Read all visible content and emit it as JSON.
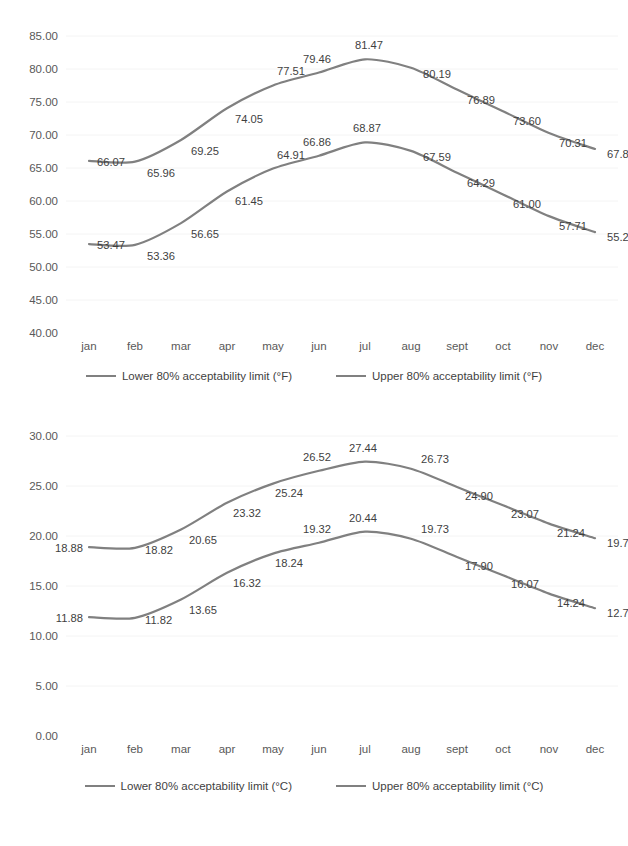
{
  "page": {
    "background_color": "#ffffff",
    "line_color": "#808080",
    "text_color": "#3f3f3f",
    "axis_text_color": "#595959"
  },
  "chart_data": [
    {
      "id": "fahrenheit-chart",
      "type": "line",
      "title": "",
      "xlabel": "",
      "ylabel": "",
      "categories": [
        "jan",
        "feb",
        "mar",
        "apr",
        "may",
        "jun",
        "jul",
        "aug",
        "sept",
        "oct",
        "nov",
        "dec"
      ],
      "ylim": [
        40.0,
        85.0
      ],
      "ytick_step": 5,
      "yticks": [
        "85.00",
        "80.00",
        "75.00",
        "70.00",
        "65.00",
        "60.00",
        "55.00",
        "50.00",
        "45.00",
        "40.00"
      ],
      "grid": false,
      "legend_position": "bottom",
      "series": [
        {
          "name": "Lower 80% acceptability limit (°F)",
          "color": "#808080",
          "values": [
            53.47,
            53.36,
            56.65,
            61.45,
            64.91,
            66.86,
            68.87,
            67.59,
            64.29,
            61.0,
            57.71,
            55.28
          ],
          "labels": [
            "53.47",
            "53.36",
            "56.65",
            "61.45",
            "64.91",
            "66.86",
            "68.87",
            "67.59",
            "64.29",
            "61.00",
            "57.71",
            "55.28"
          ]
        },
        {
          "name": "Upper 80% acceptability limit (°F)",
          "color": "#808080",
          "values": [
            66.07,
            65.96,
            69.25,
            74.05,
            77.51,
            79.46,
            81.47,
            80.19,
            76.89,
            73.6,
            70.31,
            67.88
          ],
          "labels": [
            "66.07",
            "65.96",
            "69.25",
            "74.05",
            "77.51",
            "79.46",
            "81.47",
            "80.19",
            "76.89",
            "73.60",
            "70.31",
            "67.88"
          ]
        }
      ],
      "legend": [
        {
          "label": "Lower 80% acceptability limit (°F)",
          "color": "#808080"
        },
        {
          "label": "Upper 80% acceptability limit (°F)",
          "color": "#808080"
        }
      ]
    },
    {
      "id": "celsius-chart",
      "type": "line",
      "title": "",
      "xlabel": "",
      "ylabel": "",
      "categories": [
        "jan",
        "feb",
        "mar",
        "apr",
        "may",
        "jun",
        "jul",
        "aug",
        "sept",
        "oct",
        "nov",
        "dec"
      ],
      "ylim": [
        0.0,
        30.0
      ],
      "ytick_step": 5,
      "yticks": [
        "30.00",
        "25.00",
        "20.00",
        "15.00",
        "10.00",
        "5.00",
        "0.00"
      ],
      "grid": false,
      "legend_position": "bottom",
      "series": [
        {
          "name": "Lower 80% acceptability limit (°C)",
          "color": "#808080",
          "values": [
            11.88,
            11.82,
            13.65,
            16.32,
            18.24,
            19.32,
            20.44,
            19.73,
            17.9,
            16.07,
            14.24,
            12.78
          ],
          "labels": [
            "11.88",
            "11.82",
            "13.65",
            "16.32",
            "18.24",
            "19.32",
            "20.44",
            "19.73",
            "17.90",
            "16.07",
            "14.24",
            "12.78"
          ]
        },
        {
          "name": "Upper 80% acceptability limit (°C)",
          "color": "#808080",
          "values": [
            18.88,
            18.82,
            20.65,
            23.32,
            25.24,
            26.52,
            27.44,
            26.73,
            24.9,
            23.07,
            21.24,
            19.78
          ],
          "labels": [
            "18.88",
            "18.82",
            "20.65",
            "23.32",
            "25.24",
            "26.52",
            "27.44",
            "26.73",
            "24.90",
            "23.07",
            "21.24",
            "19.78"
          ]
        }
      ],
      "legend": [
        {
          "label": "Lower 80% acceptability limit (°C)",
          "color": "#808080"
        },
        {
          "label": "Upper 80% acceptability limit (°C)",
          "color": "#808080"
        }
      ]
    }
  ]
}
